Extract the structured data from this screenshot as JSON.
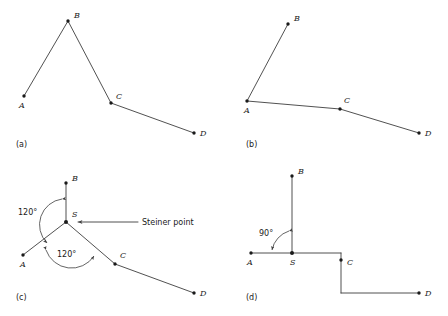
{
  "figure": {
    "stroke_color": "#3d3d3d",
    "node_color": "#1a1a1a",
    "background": "#ffffff"
  },
  "panels": [
    {
      "id": "a",
      "caption": "(a)",
      "caption_pos": {
        "x": 16,
        "y": 147
      },
      "nodes": [
        {
          "label": "A",
          "x": 24,
          "y": 96,
          "lx": 19,
          "ly": 108
        },
        {
          "label": "B",
          "x": 68,
          "y": 21,
          "lx": 74,
          "ly": 18
        },
        {
          "label": "C",
          "x": 111,
          "y": 103,
          "lx": 116,
          "ly": 99
        },
        {
          "label": "D",
          "x": 194,
          "y": 133,
          "lx": 200,
          "ly": 136
        }
      ],
      "edges": [
        {
          "from": "A",
          "to": "B"
        },
        {
          "from": "B",
          "to": "C"
        },
        {
          "from": "C",
          "to": "D"
        }
      ],
      "annotations": []
    },
    {
      "id": "b",
      "caption": "(b)",
      "caption_pos": {
        "x": 246,
        "y": 147
      },
      "nodes": [
        {
          "label": "A",
          "x": 247,
          "y": 101,
          "lx": 244,
          "ly": 113
        },
        {
          "label": "B",
          "x": 288,
          "y": 24,
          "lx": 294,
          "ly": 21
        },
        {
          "label": "C",
          "x": 340,
          "y": 109,
          "lx": 344,
          "ly": 103
        },
        {
          "label": "D",
          "x": 419,
          "y": 133,
          "lx": 425,
          "ly": 136
        }
      ],
      "edges": [
        {
          "from": "A",
          "to": "B"
        },
        {
          "from": "A",
          "to": "C"
        },
        {
          "from": "C",
          "to": "D"
        }
      ],
      "annotations": []
    },
    {
      "id": "c",
      "caption": "(c)",
      "caption_pos": {
        "x": 16,
        "y": 300
      },
      "nodes": [
        {
          "label": "B",
          "x": 66,
          "y": 183,
          "lx": 72,
          "ly": 181
        },
        {
          "label": "S",
          "x": 66,
          "y": 222,
          "lx": 72,
          "ly": 217
        },
        {
          "label": "A",
          "x": 23,
          "y": 255,
          "lx": 20,
          "ly": 267
        },
        {
          "label": "C",
          "x": 115,
          "y": 264,
          "lx": 120,
          "ly": 258
        },
        {
          "label": "D",
          "x": 194,
          "y": 293,
          "lx": 200,
          "ly": 296
        }
      ],
      "edges": [
        {
          "from": "S",
          "to": "B"
        },
        {
          "from": "S",
          "to": "A"
        },
        {
          "from": "S",
          "to": "C"
        },
        {
          "from": "C",
          "to": "D"
        }
      ],
      "annotations": [
        {
          "name": "angle-upper",
          "text": "120°",
          "x": 18,
          "y": 215
        },
        {
          "name": "angle-lower",
          "text": "120°",
          "x": 57,
          "y": 257
        },
        {
          "name": "steiner-point-callout",
          "text": "Steiner point",
          "x": 142,
          "y": 225
        }
      ]
    },
    {
      "id": "d",
      "caption": "(d)",
      "caption_pos": {
        "x": 246,
        "y": 300
      },
      "nodes": [
        {
          "label": "B",
          "x": 292,
          "y": 176,
          "lx": 298,
          "ly": 174
        },
        {
          "label": "A",
          "x": 251,
          "y": 253,
          "lx": 247,
          "ly": 265
        },
        {
          "label": "S",
          "x": 292,
          "y": 253,
          "lx": 290,
          "ly": 265
        },
        {
          "label": "C",
          "x": 341,
          "y": 260,
          "lx": 347,
          "ly": 265
        },
        {
          "label": "D",
          "x": 419,
          "y": 293,
          "lx": 425,
          "ly": 296
        }
      ],
      "edges": [
        {
          "from": "S",
          "to": "B"
        },
        {
          "from": "A",
          "to": "S"
        },
        {
          "from": "S",
          "to": "C-corner"
        },
        {
          "from": "C",
          "to": "D-corner"
        },
        {
          "from": "D-corner",
          "to": "D"
        }
      ],
      "annotations": [
        {
          "name": "angle-right",
          "text": "90°",
          "x": 259,
          "y": 236
        }
      ]
    }
  ]
}
